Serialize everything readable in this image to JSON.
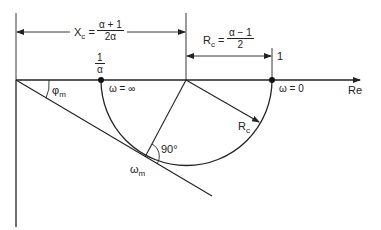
{
  "diagram": {
    "type": "Nyquist plot of lead compensator (polar plot semicircle)",
    "axis": {
      "real_label": "Re"
    },
    "points": {
      "inv_alpha": {
        "label_num": "1",
        "label_den": "α",
        "omega_label": "ω = ∞"
      },
      "one": {
        "label": "1",
        "omega_label": "ω = 0"
      },
      "max_phase": {
        "label": "ω",
        "sub": "m"
      }
    },
    "dimensions": {
      "xc": {
        "lhs": "X",
        "lhs_sub": "c",
        "eq": "=",
        "num": "α + 1",
        "den": "2α"
      },
      "rc": {
        "lhs": "R",
        "lhs_sub": "c",
        "eq": "=",
        "num": "α − 1",
        "den": "2"
      }
    },
    "annotations": {
      "phi": {
        "label": "φ",
        "sub": "m"
      },
      "radius": {
        "label": "R",
        "sub": "c"
      },
      "right_angle": "90°"
    },
    "colors": {
      "line": "#222222",
      "background": "#ffffff"
    }
  }
}
